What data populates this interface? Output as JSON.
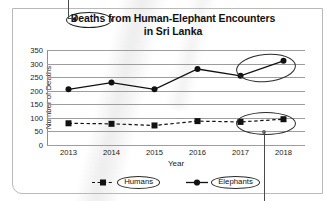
{
  "chart_data": {
    "type": "line",
    "title": "Deaths from Human-Elephant Encounters",
    "title_line1": "Deaths from Human-Elephant Encounters",
    "title_line2": "in Sri Lanka",
    "title_word_circled": "Deaths",
    "title_prefix": "Deaths",
    "title_rest": "from Human-Elephant Encounters",
    "xlabel": "Year",
    "ylabel": "Number of Deaths",
    "categories": [
      "2013",
      "2014",
      "2015",
      "2016",
      "2017",
      "2018"
    ],
    "ylim": [
      0,
      350
    ],
    "ytick_step": 50,
    "yticks": [
      "350",
      "300",
      "250",
      "200",
      "150",
      "100",
      "50",
      "0"
    ],
    "grid": true,
    "legend_position": "bottom",
    "series": [
      {
        "name": "Humans",
        "values": [
          80,
          78,
          72,
          88,
          85,
          95
        ],
        "line_style": "dashed",
        "marker": "square",
        "color": "#111111"
      },
      {
        "name": "Elephants",
        "values": [
          205,
          230,
          205,
          280,
          255,
          310
        ],
        "line_style": "solid",
        "marker": "circle",
        "color": "#111111"
      }
    ],
    "annotations": [
      {
        "name": "title-term-circle",
        "target": "Deaths",
        "shape": "ellipse"
      },
      {
        "name": "elephants-2017-2018-circle",
        "target": "Elephants 2017-2018 rise",
        "shape": "ellipse"
      },
      {
        "name": "humans-2017-2018-circle",
        "target": "Humans 2017-2018 segment",
        "shape": "ellipse"
      },
      {
        "name": "legend-humans-circle",
        "target": "Humans",
        "shape": "ellipse"
      },
      {
        "name": "legend-elephants-circle",
        "target": "Elephants",
        "shape": "ellipse"
      }
    ]
  },
  "legend": {
    "items": [
      {
        "label": "Humans"
      },
      {
        "label": "Elephants"
      }
    ]
  },
  "colors": {
    "ink": "#111111",
    "grid": "#9d9d9d",
    "frame": "#b9b9b9",
    "annotation": "#2b2b2b"
  }
}
